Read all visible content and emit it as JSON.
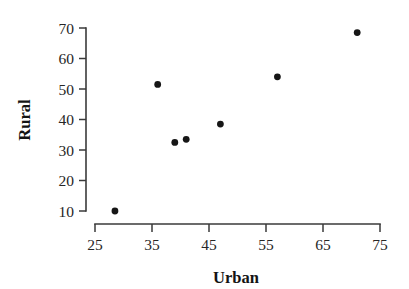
{
  "chart_data": {
    "type": "scatter",
    "title": "",
    "xlabel": "Urban",
    "ylabel": "Rural",
    "xlim": [
      25,
      75
    ],
    "ylim": [
      10,
      70
    ],
    "grid": false,
    "legend": null,
    "x_ticks": [
      25,
      35,
      45,
      55,
      65,
      75
    ],
    "y_ticks": [
      10,
      20,
      30,
      40,
      50,
      60,
      70
    ],
    "x_tick_labels": [
      "25",
      "35",
      "45",
      "55",
      "65",
      "75"
    ],
    "y_tick_labels": [
      "10",
      "20",
      "30",
      "40",
      "50",
      "60",
      "70"
    ],
    "marker": "filled-circle",
    "marker_color": "#161616",
    "points": [
      {
        "x": 28.5,
        "y": 10.0
      },
      {
        "x": 36.0,
        "y": 51.5
      },
      {
        "x": 39.0,
        "y": 32.5
      },
      {
        "x": 41.0,
        "y": 33.5
      },
      {
        "x": 47.0,
        "y": 38.5
      },
      {
        "x": 57.0,
        "y": 54.0
      },
      {
        "x": 71.0,
        "y": 68.5
      }
    ]
  },
  "axes": {
    "x_title": "Urban",
    "y_title": "Rural"
  }
}
